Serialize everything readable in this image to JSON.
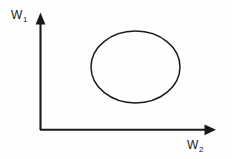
{
  "figure": {
    "name": "weight-space-region-diagram",
    "background_color": "#fefefe",
    "ink_color": "#1a1a1a",
    "width": 232,
    "height": 159
  },
  "axes": {
    "origin": {
      "x": 40,
      "y": 130
    },
    "vertical": {
      "label_base": "W",
      "label_sub": "1",
      "from_y": 130,
      "to_y": 14,
      "arrow": "up-arrow-icon"
    },
    "horizontal": {
      "label_base": "W",
      "label_sub": "2",
      "from_x": 40,
      "to_x": 216,
      "arrow": "right-arrow-icon"
    }
  },
  "shapes": [
    {
      "type": "ellipse",
      "name": "feasible-region-ellipse",
      "cx": 135.5,
      "cy": 67,
      "rx": 44.5,
      "ry": 36,
      "fill": "none",
      "stroke": "#1a1a1a",
      "stroke_width": 1.5
    }
  ],
  "chart_data": {
    "type": "scatter",
    "title": "",
    "xlabel": "W2",
    "ylabel": "W1",
    "grid": false,
    "legend": null,
    "xlim": [
      0,
      1
    ],
    "ylim": [
      0,
      1
    ],
    "annotations": [
      {
        "kind": "ellipse-contour",
        "label": "",
        "center": [
          0.54,
          0.54
        ],
        "semi_axis_x": 0.25,
        "semi_axis_y": 0.31
      }
    ]
  }
}
